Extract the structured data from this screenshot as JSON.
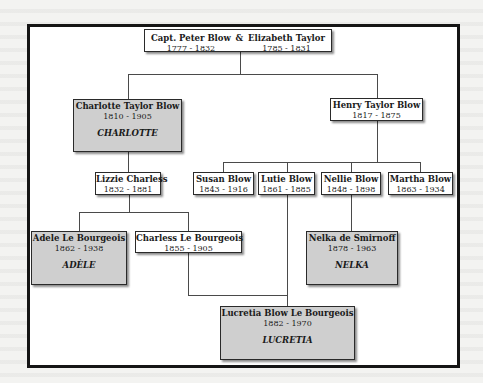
{
  "diagram": {
    "type": "family-tree",
    "root": {
      "person1": {
        "name": "Capt. Peter Blow",
        "dates": "1777 - 1832"
      },
      "connector": "&",
      "person2": {
        "name": "Elizabeth Taylor",
        "dates": "1785 - 1831"
      }
    },
    "generation2": [
      {
        "name": "Charlotte Taylor Blow",
        "dates": "1810 - 1905",
        "nickname": "CHARLOTTE",
        "highlighted": true
      },
      {
        "name": "Henry Taylor Blow",
        "dates": "1817 - 1875",
        "highlighted": false
      }
    ],
    "generation3_charlotte": [
      {
        "name": "Lizzie Charless",
        "dates": "1832 - 1881",
        "highlighted": false
      }
    ],
    "generation3_henry": [
      {
        "name": "Susan Blow",
        "dates": "1843 - 1916",
        "highlighted": false
      },
      {
        "name": "Lutie Blow",
        "dates": "1861 - 1885",
        "highlighted": false
      },
      {
        "name": "Nellie Blow",
        "dates": "1848 - 1898",
        "highlighted": false
      },
      {
        "name": "Martha Blow",
        "dates": "1863 - 1934",
        "highlighted": false
      }
    ],
    "generation4_lizzie": [
      {
        "name": "Adele Le Bourgeois",
        "dates": "1862 - 1938",
        "nickname": "ADÈLE",
        "highlighted": true
      },
      {
        "name": "Charless Le Bourgeois",
        "dates": "1855 - 1905",
        "highlighted": false
      }
    ],
    "generation4_nellie": [
      {
        "name": "Nelka de Smirnoff",
        "dates": "1878 - 1963",
        "nickname": "NELKA",
        "highlighted": true
      }
    ],
    "generation5": [
      {
        "name": "Lucretia Blow Le Bourgeois",
        "dates": "1882 - 1970",
        "nickname": "LUCRETIA",
        "highlighted": true
      }
    ],
    "colors": {
      "highlight_fill": "#cfcfcf",
      "box_fill": "#ffffff",
      "frame_border": "#151515",
      "line": "#4a4a4a"
    }
  }
}
